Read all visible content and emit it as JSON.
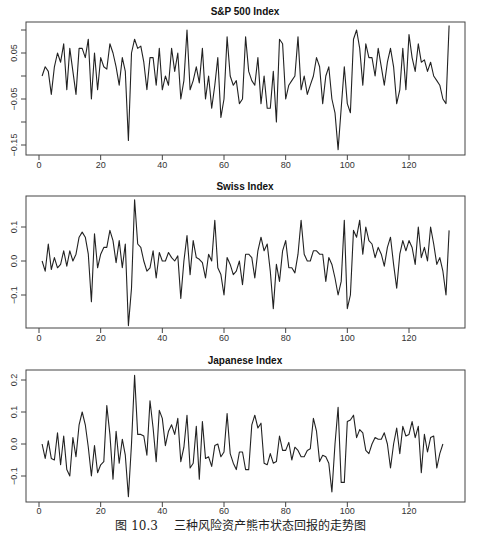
{
  "caption": {
    "figure_number": "图 10.3",
    "text": "三种风险资产熊市状态回报的走势图"
  },
  "chart_data": [
    {
      "type": "line",
      "title": "S&P 500 Index",
      "xlabel": "",
      "ylabel": "",
      "xlim": [
        1,
        133
      ],
      "ylim": [
        -0.16,
        0.12
      ],
      "x_ticks": [
        0,
        20,
        40,
        60,
        80,
        100,
        120
      ],
      "y_ticks": [
        0.1,
        0.05,
        0.0,
        -0.05,
        -0.1,
        -0.15
      ],
      "y_tick_labels": [
        "",
        "0.05",
        "",
        "-0.05",
        "",
        "-0.15"
      ],
      "grid": false,
      "values": [
        0.0,
        0.02,
        0.01,
        -0.04,
        0.02,
        0.05,
        0.03,
        0.07,
        -0.03,
        0.06,
        0.01,
        -0.04,
        0.06,
        0.06,
        0.04,
        0.08,
        -0.05,
        0.05,
        -0.03,
        0.04,
        0.02,
        0.015,
        0.07,
        0.05,
        0.02,
        -0.02,
        0.04,
        0.01,
        -0.14,
        0.05,
        0.08,
        0.06,
        0.065,
        0.03,
        -0.03,
        0.04,
        0.04,
        -0.02,
        0.06,
        -0.03,
        0.0,
        -0.02,
        0.06,
        0.01,
        0.05,
        -0.05,
        -0.01,
        0.1,
        -0.03,
        -0.01,
        0.02,
        -0.015,
        0.06,
        -0.05,
        0.0,
        -0.07,
        -0.02,
        0.04,
        -0.09,
        -0.05,
        0.085,
        0.0,
        -0.02,
        -0.01,
        -0.06,
        -0.05,
        0.085,
        0.01,
        -0.01,
        -0.02,
        0.04,
        -0.06,
        0.0,
        -0.07,
        -0.07,
        0.01,
        -0.1,
        0.08,
        0.07,
        -0.05,
        -0.02,
        -0.01,
        0.0,
        0.085,
        -0.03,
        0.0,
        -0.04,
        -0.02,
        0.0,
        0.04,
        0.02,
        -0.06,
        0.0,
        0.02,
        -0.05,
        -0.08,
        -0.16,
        -0.07,
        0.02,
        -0.06,
        -0.08,
        0.08,
        0.1,
        0.06,
        -0.02,
        0.07,
        0.04,
        0.04,
        0.0,
        0.06,
        0.02,
        -0.02,
        0.03,
        0.06,
        0.02,
        -0.06,
        -0.03,
        0.06,
        -0.03,
        0.09,
        0.04,
        0.01,
        0.07,
        0.03,
        0.035,
        0.01,
        0.03,
        0.0,
        -0.01,
        -0.02,
        -0.05,
        -0.06,
        0.11
      ]
    },
    {
      "type": "line",
      "title": "Swiss Index",
      "xlabel": "",
      "ylabel": "",
      "xlim": [
        1,
        133
      ],
      "ylim": [
        -0.19,
        0.19
      ],
      "x_ticks": [
        0,
        20,
        40,
        60,
        80,
        100,
        120
      ],
      "y_ticks": [
        0.1,
        0.0,
        -0.1
      ],
      "y_tick_labels": [
        "0.1",
        "0.0",
        "-0.1"
      ],
      "grid": false,
      "values": [
        0.0,
        -0.03,
        0.05,
        -0.025,
        0.01,
        -0.02,
        -0.01,
        0.03,
        -0.015,
        0.03,
        0.0,
        0.02,
        0.07,
        0.085,
        0.07,
        0.02,
        -0.12,
        0.08,
        -0.02,
        0.02,
        0.04,
        0.04,
        0.09,
        0.06,
        -0.005,
        0.06,
        -0.02,
        0.05,
        -0.19,
        -0.08,
        0.18,
        0.05,
        0.04,
        0.0,
        -0.03,
        -0.02,
        0.03,
        -0.05,
        0.025,
        0.0,
        0.0,
        0.025,
        0.01,
        0.0,
        0.015,
        -0.11,
        0.0,
        0.075,
        -0.04,
        0.06,
        0.01,
        0.005,
        -0.005,
        -0.05,
        0.02,
        0.0,
        0.12,
        -0.02,
        -0.04,
        -0.1,
        0.01,
        -0.01,
        -0.04,
        -0.03,
        0.0,
        -0.07,
        0.02,
        0.02,
        0.01,
        -0.05,
        0.03,
        0.07,
        0.03,
        0.05,
        -0.03,
        -0.14,
        -0.01,
        -0.06,
        0.03,
        0.06,
        -0.02,
        -0.02,
        -0.035,
        0.02,
        0.12,
        0.02,
        0.0,
        0.0,
        0.03,
        0.03,
        0.02,
        0.02,
        -0.06,
        0.01,
        -0.01,
        -0.05,
        -0.1,
        -0.06,
        0.12,
        -0.14,
        -0.1,
        0.09,
        0.07,
        0.12,
        0.02,
        0.1,
        0.06,
        0.05,
        0.01,
        0.04,
        0.02,
        -0.015,
        0.04,
        0.07,
        -0.01,
        -0.08,
        0.02,
        0.06,
        0.03,
        0.06,
        0.04,
        -0.01,
        0.1,
        0.01,
        0.04,
        0.0,
        0.1,
        0.05,
        -0.01,
        0.01,
        -0.03,
        -0.1,
        0.09
      ]
    },
    {
      "type": "line",
      "title": "Japanese Index",
      "xlabel": "",
      "ylabel": "",
      "xlim": [
        1,
        133
      ],
      "ylim": [
        -0.17,
        0.22
      ],
      "x_ticks": [
        0,
        20,
        40,
        60,
        80,
        100,
        120
      ],
      "y_ticks": [
        0.2,
        0.1,
        0.0,
        -0.1
      ],
      "y_tick_labels": [
        "0.2",
        "0.1",
        "0.0",
        "-0.1"
      ],
      "grid": false,
      "values": [
        0.0,
        -0.045,
        0.01,
        -0.045,
        -0.05,
        0.035,
        -0.065,
        0.025,
        -0.08,
        -0.1,
        0.02,
        -0.04,
        0.06,
        0.1,
        0.06,
        -0.01,
        -0.1,
        -0.005,
        -0.09,
        -0.065,
        -0.055,
        0.12,
        0.03,
        -0.11,
        0.04,
        -0.06,
        0.015,
        -0.035,
        -0.165,
        0.0,
        0.215,
        0.03,
        0.03,
        0.025,
        -0.035,
        0.135,
        0.05,
        -0.055,
        0.105,
        0.08,
        -0.005,
        0.04,
        0.06,
        0.03,
        0.08,
        -0.055,
        -0.01,
        0.09,
        -0.075,
        -0.06,
        0.055,
        -0.11,
        0.07,
        -0.045,
        -0.04,
        -0.07,
        -0.005,
        0.0,
        -0.04,
        -0.025,
        0.095,
        -0.03,
        -0.06,
        -0.08,
        -0.025,
        -0.025,
        -0.08,
        -0.08,
        0.06,
        0.09,
        0.05,
        0.065,
        -0.06,
        -0.065,
        -0.03,
        -0.06,
        -0.055,
        0.025,
        -0.02,
        -0.02,
        0.005,
        -0.05,
        -0.01,
        -0.02,
        -0.04,
        -0.04,
        -0.02,
        -0.015,
        0.08,
        0.04,
        -0.055,
        -0.035,
        -0.04,
        -0.06,
        -0.15,
        0.0,
        0.115,
        -0.12,
        -0.12,
        0.07,
        0.075,
        0.09,
        0.02,
        0.045,
        0.035,
        -0.02,
        -0.03,
        0.0,
        0.02,
        0.015,
        0.015,
        0.035,
        0.0,
        -0.075,
        0.0,
        0.05,
        -0.03,
        0.055,
        0.025,
        0.03,
        0.07,
        0.02,
        0.055,
        -0.09,
        0.03,
        -0.025,
        0.02,
        0.025,
        -0.075,
        -0.03,
        0.0
      ]
    }
  ]
}
